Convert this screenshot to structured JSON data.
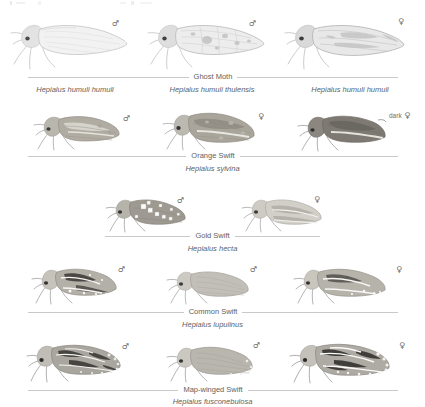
{
  "plate": {
    "background_color": "#ffffff",
    "rule_color": "#c9c9c9",
    "text_color": "#616161",
    "symbols": {
      "male": "♂",
      "female": "♀"
    },
    "rows": [
      {
        "common_name": "Ghost Moth",
        "binomial": "",
        "rule": {
          "left": 28,
          "right": 398
        },
        "specimens": [
          {
            "sex": "♂",
            "variant": "",
            "caption": "Hepialus humuli humuli"
          },
          {
            "sex": "♂",
            "variant": "",
            "caption": "Hepialus humuli thulensis"
          },
          {
            "sex": "♀",
            "variant": "",
            "caption": "Hepialus humuli humuli"
          }
        ]
      },
      {
        "common_name": "Orange Swift",
        "binomial": "Hepialus sylvina",
        "rule": {
          "left": 28,
          "right": 398
        },
        "specimens": [
          {
            "sex": "♂",
            "variant": "",
            "caption": ""
          },
          {
            "sex": "♀",
            "variant": "",
            "caption": ""
          },
          {
            "sex": "♀",
            "variant": "dark",
            "caption": ""
          }
        ]
      },
      {
        "common_name": "Gold Swift",
        "binomial": "Hepialus hecta",
        "rule": {
          "left": 105,
          "right": 320
        },
        "specimens": [
          {
            "sex": "♂",
            "variant": "",
            "caption": ""
          },
          {
            "sex": "♀",
            "variant": "",
            "caption": ""
          }
        ]
      },
      {
        "common_name": "Common Swift",
        "binomial": "Hepialus lupulinus",
        "rule": {
          "left": 28,
          "right": 398
        },
        "specimens": [
          {
            "sex": "♂",
            "variant": "",
            "caption": ""
          },
          {
            "sex": "♂",
            "variant": "",
            "caption": ""
          },
          {
            "sex": "♀",
            "variant": "",
            "caption": ""
          }
        ]
      },
      {
        "common_name": "Map-winged Swift",
        "binomial": "Hepialus fusconebulosa",
        "rule": {
          "left": 28,
          "right": 398
        },
        "specimens": [
          {
            "sex": "♂",
            "variant": "",
            "caption": ""
          },
          {
            "sex": "♂",
            "variant": "",
            "caption": ""
          },
          {
            "sex": "♀",
            "variant": "",
            "caption": ""
          }
        ]
      }
    ]
  }
}
